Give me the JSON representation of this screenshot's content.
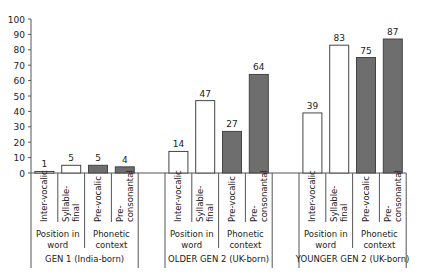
{
  "chart_data": {
    "type": "bar",
    "title": "",
    "xlabel": "",
    "ylabel": "",
    "ylim": [
      0,
      100
    ],
    "yticks": [
      0,
      10,
      20,
      30,
      40,
      50,
      60,
      70,
      80,
      90,
      100
    ],
    "grid": false,
    "legend": null,
    "groups": [
      {
        "label": "GEN 1 (India-born)",
        "subgroups": [
          {
            "label": "Position in word",
            "categories": [
              "Inter-vocalic",
              "Syllable-final"
            ],
            "values": [
              1,
              5
            ],
            "fill": "#ffffff"
          },
          {
            "label": "Phonetic context",
            "categories": [
              "Pre-vocalic",
              "Pre-consonantal"
            ],
            "values": [
              5,
              4
            ],
            "fill": "#6e6e6e"
          }
        ]
      },
      {
        "label": "OLDER GEN 2 (UK-born)",
        "subgroups": [
          {
            "label": "Position in word",
            "categories": [
              "Inter-vocalic",
              "Syllable-final"
            ],
            "values": [
              14,
              47
            ],
            "fill": "#ffffff"
          },
          {
            "label": "Phonetic context",
            "categories": [
              "Pre-vocalic",
              "Pre-consonantal"
            ],
            "values": [
              27,
              64
            ],
            "fill": "#6e6e6e"
          }
        ]
      },
      {
        "label": "YOUNGER GEN 2 (UK-born)",
        "subgroups": [
          {
            "label": "Position in word",
            "categories": [
              "Inter-vocalic",
              "Syllable-final"
            ],
            "values": [
              39,
              83
            ],
            "fill": "#ffffff"
          },
          {
            "label": "Phonetic context",
            "categories": [
              "Pre-vocalic",
              "Pre-consonantal"
            ],
            "values": [
              75,
              87
            ],
            "fill": "#6e6e6e"
          }
        ]
      }
    ],
    "category_labels_display": {
      "Inter-vocalic": [
        "Inter-vocalic"
      ],
      "Syllable-final": [
        "Syllable-",
        "final"
      ],
      "Pre-vocalic": [
        "Pre-vocalic"
      ],
      "Pre-consonantal": [
        "Pre-",
        "consonantal"
      ]
    },
    "subgroup_labels_display": {
      "Position in word": [
        "Position in",
        "word"
      ],
      "Phonetic context": [
        "Phonetic",
        "context"
      ]
    }
  }
}
